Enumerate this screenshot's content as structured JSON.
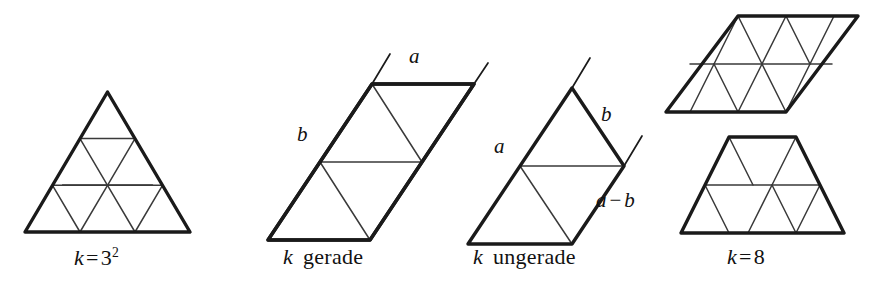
{
  "figure": {
    "background_color": "#ffffff",
    "line_color": "#1a1a1a",
    "thin_line_color": "#3a3a3a"
  },
  "panels": [
    {
      "id": "panel-triangle",
      "caption_parts": {
        "var": "k",
        "op": "=",
        "num": "3",
        "exp": "2"
      },
      "caption_text": "k = 3²",
      "shape": "triangle",
      "rows": 3
    },
    {
      "id": "panel-parallelogram-even",
      "caption_parts": {
        "var": "k",
        "word": "gerade"
      },
      "caption_text": "k gerade",
      "shape": "parallelogram",
      "labels": [
        {
          "name": "a",
          "text": "a"
        },
        {
          "name": "b",
          "text": "b"
        }
      ]
    },
    {
      "id": "panel-trapezoid-odd",
      "caption_parts": {
        "var": "k",
        "word": "ungerade"
      },
      "caption_text": "k ungerade",
      "shape": "trapezoid",
      "labels": [
        {
          "name": "a",
          "text": "a"
        },
        {
          "name": "b",
          "text": "b"
        },
        {
          "name": "a-minus-b",
          "lhs": "a",
          "op": "−",
          "rhs": "b",
          "text": "a − b"
        }
      ]
    },
    {
      "id": "panel-k8",
      "caption_parts": {
        "var": "k",
        "op": "=",
        "num": "8"
      },
      "caption_text": "k = 8",
      "shapes": [
        "parallelogram",
        "trapezoid"
      ]
    }
  ],
  "labels": {
    "fig2_a": "a",
    "fig2_b": "b",
    "fig3_a": "a",
    "fig3_b": "b",
    "fig3_amb_lhs": "a",
    "fig3_amb_op": "−",
    "fig3_amb_rhs": "b",
    "fig1_caption_var": "k",
    "fig1_caption_op": "=",
    "fig1_caption_num": "3",
    "fig1_caption_exp": "2",
    "fig2_caption_var": "k",
    "fig2_caption_word": "gerade",
    "fig3_caption_var": "k",
    "fig3_caption_word": "ungerade",
    "fig4_caption_var": "k",
    "fig4_caption_op": "=",
    "fig4_caption_num": "8"
  }
}
